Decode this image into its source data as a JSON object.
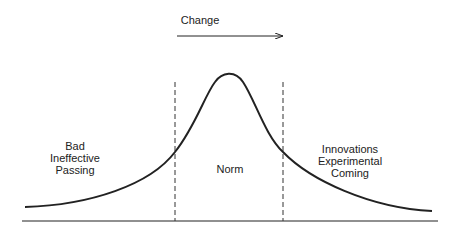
{
  "diagram": {
    "arrow_label": "Change",
    "left_region": [
      "Bad",
      "Ineffective",
      "Passing"
    ],
    "center_region": "Norm",
    "right_region": [
      "Innovations",
      "Experimental",
      "Coming"
    ],
    "colors": {
      "line": "#222222",
      "background": "#ffffff"
    }
  }
}
